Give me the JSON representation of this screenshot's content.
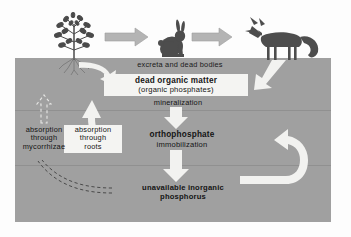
{
  "diagram": {
    "soil_color": "#9a9a9a",
    "sky_color": "#fdfdfd",
    "arrow_white": "#f2f2f0",
    "arrow_gray": "#b4b4b4",
    "organism_color": "#4d4d4d",
    "text_color": "#141414",
    "box_color": "#f4f4f2"
  },
  "organisms": [
    {
      "name": "plant",
      "label": "plant"
    },
    {
      "name": "rabbit",
      "label": "rabbit"
    },
    {
      "name": "fox",
      "label": "fox"
    }
  ],
  "labels": {
    "excreta": "excreta and dead bodies",
    "dead_organic_matter": "dead organic matter",
    "organic_phosphates": "(organic phosphates)",
    "mineralization": "mineralization",
    "orthophosphate": "orthophosphate",
    "immobilization": "immobilization",
    "unavailable_line1": "unavailable inorganic",
    "unavailable_line2": "phosphorus",
    "absorption_mycorrhizae_line1": "absorption",
    "absorption_mycorrhizae_line2": "through",
    "absorption_mycorrhizae_line3": "mycorrhizae",
    "absorption_roots_line1": "absorption",
    "absorption_roots_line2": "through",
    "absorption_roots_line3": "roots"
  },
  "flows": [
    {
      "from": "plant",
      "to": "rabbit",
      "style": "solid-gray-arrow"
    },
    {
      "from": "rabbit",
      "to": "fox",
      "style": "solid-gray-arrow"
    },
    {
      "from": "plant",
      "to": "dead organic matter",
      "style": "curved-white-arrow"
    },
    {
      "from": "fox",
      "to": "dead organic matter",
      "style": "white-arrow"
    },
    {
      "from": "dead organic matter",
      "to": "orthophosphate",
      "style": "white-arrow",
      "label": "mineralization"
    },
    {
      "from": "orthophosphate",
      "to": "unavailable inorganic phosphorus",
      "style": "white-arrow",
      "label": "immobilization"
    },
    {
      "from": "unavailable inorganic phosphorus",
      "to": "orthophosphate",
      "style": "curved-white-arrow"
    },
    {
      "from": "orthophosphate",
      "to": "plant roots",
      "style": "curved-white-arrow",
      "label": "absorption through roots"
    },
    {
      "from": "soil",
      "to": "plant mycorrhizae",
      "style": "dashed-outline-arrow",
      "label": "absorption through mycorrhizae"
    }
  ]
}
